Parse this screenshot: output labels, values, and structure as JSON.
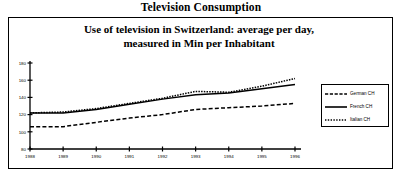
{
  "outer_title": "Television Consumption",
  "chart_data": {
    "type": "line",
    "title_lines": [
      "Use of television in Switzerland: average per day,",
      "measured in Min per Inhabitant"
    ],
    "title": "Use of television in Switzerland: average per day, measured in Min per Inhabitant",
    "xlabel": "",
    "ylabel": "",
    "categories": [
      "1988",
      "1989",
      "1990",
      "1991",
      "1992",
      "1993",
      "1994",
      "1995",
      "1996"
    ],
    "x": [
      1988,
      1989,
      1990,
      1991,
      1992,
      1993,
      1994,
      1995,
      1996
    ],
    "xlim": [
      1988,
      1996
    ],
    "ylim": [
      80,
      180
    ],
    "yticks": [
      80,
      100,
      120,
      140,
      160,
      180
    ],
    "xticks": [
      "1988",
      "1989",
      "1990",
      "1991",
      "1992",
      "1993",
      "1994",
      "1995",
      "1996"
    ],
    "grid": false,
    "legend_position": "right",
    "series": [
      {
        "name": "German CH",
        "style": "dotted",
        "color": "#000000",
        "values": [
          122,
          123,
          127,
          133,
          139,
          147,
          146,
          153,
          162
        ]
      },
      {
        "name": "French CH",
        "style": "solid",
        "color": "#000000",
        "values": [
          122,
          122,
          126,
          132,
          138,
          143,
          145,
          150,
          155
        ]
      },
      {
        "name": "Italian CH",
        "style": "dashed",
        "color": "#000000",
        "values": [
          106,
          106,
          111,
          116,
          120,
          126,
          128,
          130,
          133
        ]
      }
    ]
  },
  "legend": {
    "items": [
      {
        "label": "German CH",
        "style": "dotted"
      },
      {
        "label": "French CH",
        "style": "solid"
      },
      {
        "label": "Italian CH",
        "style": "dashed"
      }
    ]
  }
}
